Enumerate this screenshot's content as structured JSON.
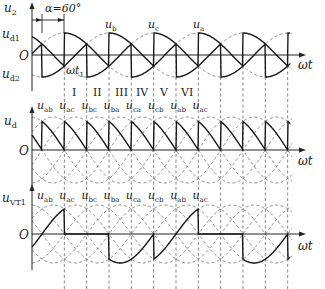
{
  "figure": {
    "alpha_label": "α=60°",
    "origin_label": "O",
    "x_axis_label": "ωt",
    "wt1_label": "ωt",
    "wt1_sub": "1"
  },
  "panels": [
    {
      "id": "u2",
      "y_label": "u",
      "y_label_sub": "2",
      "extra_labels": [
        {
          "text": "u",
          "sub": "d1"
        },
        {
          "text": "u",
          "sub": "d2"
        }
      ],
      "phase_labels": [
        {
          "text": "u",
          "sub": "b"
        },
        {
          "text": "u",
          "sub": "c"
        },
        {
          "text": "u",
          "sub": "a"
        }
      ],
      "intervals": [
        "I",
        "II",
        "III",
        "IV",
        "V",
        "VI"
      ]
    },
    {
      "id": "ud",
      "y_label": "u",
      "y_label_sub": "d",
      "line_labels": [
        {
          "text": "u",
          "sub": "ab"
        },
        {
          "text": "u",
          "sub": "ac"
        },
        {
          "text": "u",
          "sub": "bc"
        },
        {
          "text": "u",
          "sub": "ba"
        },
        {
          "text": "u",
          "sub": "ca"
        },
        {
          "text": "u",
          "sub": "cb"
        },
        {
          "text": "u",
          "sub": "ab"
        },
        {
          "text": "u",
          "sub": "ac"
        }
      ]
    },
    {
      "id": "uVT1",
      "y_label": "u",
      "y_label_sub": "VT1",
      "line_labels": [
        {
          "text": "u",
          "sub": "ab"
        },
        {
          "text": "u",
          "sub": "ac"
        },
        {
          "text": "u",
          "sub": "bc"
        },
        {
          "text": "u",
          "sub": "ba"
        },
        {
          "text": "u",
          "sub": "ca"
        },
        {
          "text": "u",
          "sub": "cb"
        },
        {
          "text": "u",
          "sub": "ab"
        },
        {
          "text": "u",
          "sub": "ac"
        }
      ]
    }
  ],
  "colors": {
    "waveform": "#1a1a1a",
    "dashed": "#777777",
    "axis": "#222222"
  }
}
